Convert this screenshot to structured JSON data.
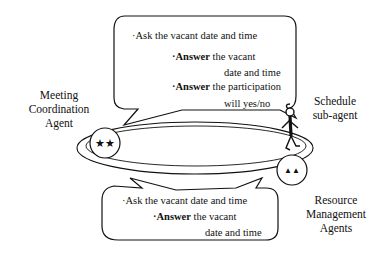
{
  "diagram": {
    "labels": {
      "meeting_agent": [
        "Meeting",
        "Coordination",
        "Agent"
      ],
      "schedule_agent": [
        "Schedule",
        "sub-agent"
      ],
      "resource_agents": [
        "Resource",
        "Management",
        "Agents"
      ]
    },
    "top_bubble": {
      "line1": "·Ask the vacant date and time",
      "line2_bold": "·Answer",
      "line2_rest": " the vacant",
      "line3": "date and time",
      "line4_bold": "·Answer",
      "line4_rest": " the participation",
      "line5": "will yes/no"
    },
    "bottom_bubble": {
      "line1": "·Ask the vacant date and time",
      "line2_bold": "·Answer",
      "line2_rest": " the vacant",
      "line3": "date and time"
    },
    "node_symbols": {
      "meeting_agent": "★★",
      "resource_agents": "▲▲"
    },
    "icons": [
      "stick-figure-icon"
    ]
  }
}
